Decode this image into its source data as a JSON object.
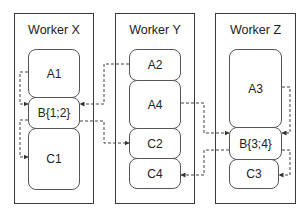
{
  "workers": [
    {
      "title": "Worker X",
      "blocks": [
        "A1",
        "B{1;2}",
        "C1"
      ]
    },
    {
      "title": "Worker Y",
      "blocks": [
        "A2",
        "A4",
        "C2",
        "C4"
      ]
    },
    {
      "title": "Worker Z",
      "blocks": [
        "A3",
        "B{3;4}",
        "C3"
      ]
    }
  ],
  "edges": [
    {
      "from": "A1",
      "to": "B{1;2}"
    },
    {
      "from": "A2",
      "to": "B{1;2}"
    },
    {
      "from": "B{1;2}",
      "to": "C1"
    },
    {
      "from": "B{1;2}",
      "to": "C2"
    },
    {
      "from": "A3",
      "to": "B{3;4}"
    },
    {
      "from": "A4",
      "to": "B{3;4}"
    },
    {
      "from": "B{3;4}",
      "to": "C3"
    },
    {
      "from": "B{3;4}",
      "to": "C4"
    }
  ],
  "style": {
    "edge_color": "#444444",
    "edge_dash": "3,2",
    "border_color": "#3a3a3a"
  }
}
